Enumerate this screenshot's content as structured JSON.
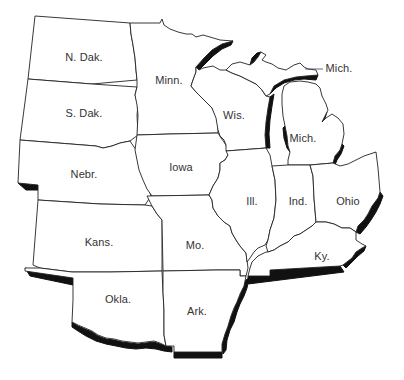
{
  "map": {
    "title": "",
    "region": "Midwest United States",
    "colors": {
      "fill": "#ffffff",
      "border": "#222222",
      "shadow": "#111111",
      "label": "#333333"
    },
    "states": [
      {
        "id": "nd",
        "label": "N. Dak.",
        "x": 84,
        "y": 57
      },
      {
        "id": "sd",
        "label": "S. Dak.",
        "x": 84,
        "y": 113
      },
      {
        "id": "nebr",
        "label": "Nebr.",
        "x": 84,
        "y": 174
      },
      {
        "id": "kans",
        "label": "Kans.",
        "x": 99,
        "y": 242
      },
      {
        "id": "okla",
        "label": "Okla.",
        "x": 118,
        "y": 299
      },
      {
        "id": "minn",
        "label": "Minn.",
        "x": 169,
        "y": 80
      },
      {
        "id": "iowa",
        "label": "Iowa",
        "x": 181,
        "y": 167
      },
      {
        "id": "mo",
        "label": "Mo.",
        "x": 195,
        "y": 245
      },
      {
        "id": "ark",
        "label": "Ark.",
        "x": 197,
        "y": 311
      },
      {
        "id": "wis",
        "label": "Wis.",
        "x": 234,
        "y": 115
      },
      {
        "id": "ill",
        "label": "Ill.",
        "x": 252,
        "y": 201
      },
      {
        "id": "mich-lower",
        "label": "Mich.",
        "x": 303,
        "y": 138
      },
      {
        "id": "ind",
        "label": "Ind.",
        "x": 298,
        "y": 201
      },
      {
        "id": "ohio",
        "label": "Ohio",
        "x": 348,
        "y": 201
      },
      {
        "id": "ky",
        "label": "Ky.",
        "x": 322,
        "y": 256
      }
    ],
    "callouts": [
      {
        "id": "mich-upper",
        "label": "Mich.",
        "x": 339,
        "y": 68,
        "line": {
          "x1": 305,
          "y1": 69,
          "x2": 323,
          "y2": 69
        }
      }
    ]
  }
}
